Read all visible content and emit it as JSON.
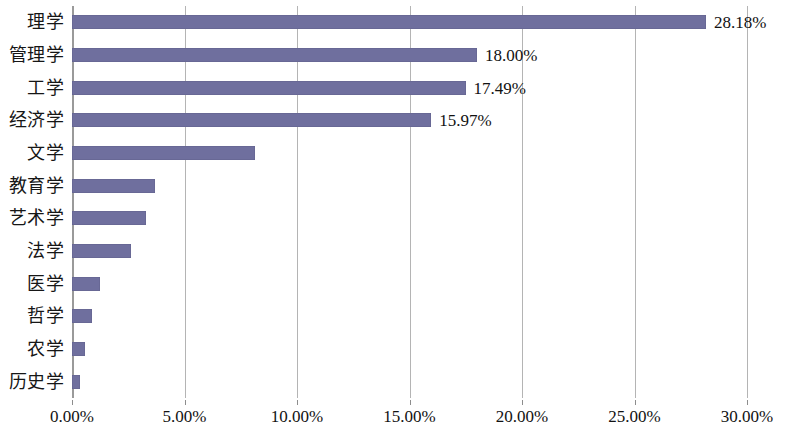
{
  "chart_data": {
    "type": "bar",
    "orientation": "horizontal",
    "title": "",
    "subtitle": "",
    "xlabel": "",
    "ylabel": "",
    "xlim": [
      0,
      30
    ],
    "xtick_values": [
      0,
      5,
      10,
      15,
      20,
      25,
      30
    ],
    "xtick_labels": [
      "0.00%",
      "5.00%",
      "10.00%",
      "15.00%",
      "20.00%",
      "25.00%",
      "30.00%"
    ],
    "grid": "vertical",
    "legend": "none",
    "series_color": "#6f6f9e",
    "categories": [
      "历史学",
      "农学",
      "哲学",
      "医学",
      "法学",
      "艺术学",
      "教育学",
      "文学",
      "经济学",
      "工学",
      "管理学",
      "理学"
    ],
    "values": [
      0.35,
      0.57,
      0.9,
      1.25,
      2.62,
      3.28,
      3.7,
      8.13,
      15.97,
      17.49,
      18.0,
      28.18
    ],
    "bars": [
      {
        "category": "历史学",
        "value": 0.35,
        "label": ""
      },
      {
        "category": "农学",
        "value": 0.57,
        "label": ""
      },
      {
        "category": "哲学",
        "value": 0.9,
        "label": ""
      },
      {
        "category": "医学",
        "value": 1.25,
        "label": ""
      },
      {
        "category": "法学",
        "value": 2.62,
        "label": ""
      },
      {
        "category": "艺术学",
        "value": 3.28,
        "label": ""
      },
      {
        "category": "教育学",
        "value": 3.7,
        "label": ""
      },
      {
        "category": "文学",
        "value": 8.13,
        "label": ""
      },
      {
        "category": "经济学",
        "value": 15.97,
        "label": "15.97%"
      },
      {
        "category": "工学",
        "value": 17.49,
        "label": "17.49%"
      },
      {
        "category": "管理学",
        "value": 18.0,
        "label": "18.00%"
      },
      {
        "category": "理学",
        "value": 28.18,
        "label": "28.18%"
      }
    ],
    "data_labels": [
      "15.97%",
      "17.49%",
      "18.00%",
      "28.18%"
    ]
  }
}
